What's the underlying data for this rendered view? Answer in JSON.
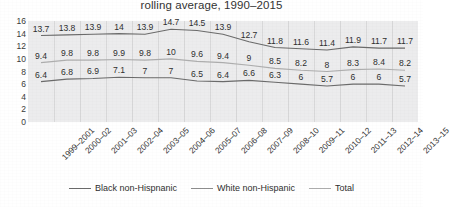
{
  "chart_data": {
    "type": "line",
    "title": "rolling average, 1990–2015",
    "xlabel": "",
    "ylabel": "",
    "ylim": [
      0,
      16
    ],
    "yticks": [
      16,
      14,
      12,
      10,
      8,
      6,
      4,
      2,
      0
    ],
    "grid": "vertical",
    "legend_position": "bottom",
    "categories": [
      "1999–2001",
      "2000–02",
      "2001–03",
      "2002–04",
      "2003–05",
      "2004–06",
      "2005–07",
      "2006–08",
      "2007–09",
      "2008–10",
      "2009–11",
      "2010–12",
      "2011–13",
      "2012–14",
      "2013–15"
    ],
    "series": [
      {
        "name": "Black non-Hispnanic",
        "color": "#6b6b6b",
        "values": [
          13.7,
          13.8,
          13.9,
          14,
          13.9,
          14.7,
          14.5,
          13.9,
          12.7,
          11.8,
          11.6,
          11.4,
          11.9,
          11.7,
          11.7
        ],
        "labels": [
          "13.7",
          "13.8",
          "13.9",
          "14",
          "13.9",
          "14.7",
          "14.5",
          "13.9",
          "12.7",
          "11.8",
          "11.6",
          "11.4",
          "11.9",
          "11.7",
          "11.7"
        ]
      },
      {
        "name": "Total",
        "color": "#aeaeae",
        "values": [
          9.4,
          9.8,
          9.8,
          9.9,
          9.8,
          10,
          9.6,
          9.4,
          9,
          8.5,
          8.2,
          8,
          8.3,
          8.4,
          8.2
        ],
        "labels": [
          "9.4",
          "9.8",
          "9.8",
          "9.9",
          "9.8",
          "10",
          "9.6",
          "9.4",
          "9",
          "8.5",
          "8.2",
          "8",
          "8.3",
          "8.4",
          "8.2"
        ]
      },
      {
        "name": "White non-Hispanic",
        "color": "#6b6b6b",
        "values": [
          6.4,
          6.8,
          6.9,
          7.1,
          7,
          7,
          6.5,
          6.4,
          6.6,
          6.3,
          6,
          5.7,
          6,
          6,
          5.7
        ],
        "labels": [
          "6.4",
          "6.8",
          "6.9",
          "7.1",
          "7",
          "7",
          "6.5",
          "6.4",
          "6.6",
          "6.3",
          "6",
          "5.7",
          "6",
          "6",
          "5.7"
        ]
      }
    ],
    "legend": [
      {
        "label": "Black non-Hispnanic",
        "color": "#6b6b6b"
      },
      {
        "label": "White non-Hispanic",
        "color": "#8e8e8e"
      },
      {
        "label": "Total",
        "color": "#aeaeae"
      }
    ]
  }
}
